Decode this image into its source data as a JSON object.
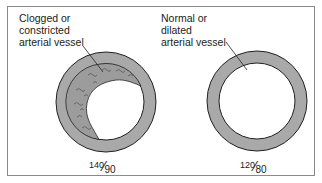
{
  "diagram": {
    "left_panel": {
      "label_lines": [
        "Clogged or",
        "constricted",
        "arterial vessel"
      ],
      "bp_systolic": "140",
      "bp_diastolic": "90",
      "vessel": "clogged-vessel"
    },
    "right_panel": {
      "label_lines": [
        "Normal or",
        "dilated",
        "arterial vessel"
      ],
      "bp_systolic": "120",
      "bp_diastolic": "80",
      "vessel": "normal-vessel"
    },
    "colors": {
      "vessel_wall": "#a9a9a9",
      "plaque": "#9c9c9c",
      "outline": "#222222",
      "frame": "#8a8a8a"
    }
  }
}
